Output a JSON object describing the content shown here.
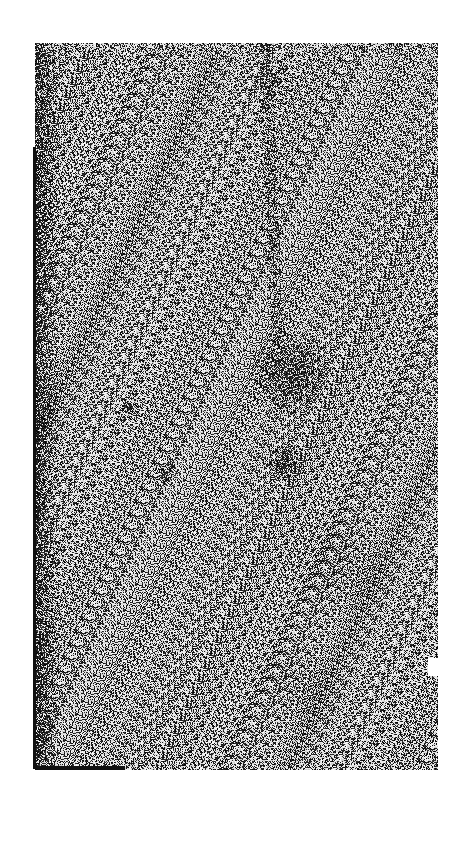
{
  "document": {
    "type": "scanned-page",
    "description": "Noisy black-and-white scan of a blank textured page",
    "text_content": "",
    "colors": {
      "background": "#ffffff",
      "ink": "#111111",
      "paper_mid": "#9a9a9a"
    }
  }
}
